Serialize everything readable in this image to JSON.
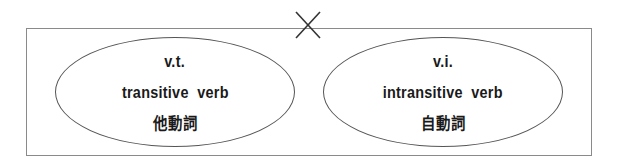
{
  "diagram": {
    "separator_icon": "cross-x",
    "left": {
      "abbreviation": "v.t.",
      "english": "transitive  verb",
      "japanese": "他動詞"
    },
    "right": {
      "abbreviation": "v.i.",
      "english": "intransitive  verb",
      "japanese": "自動詞"
    }
  }
}
